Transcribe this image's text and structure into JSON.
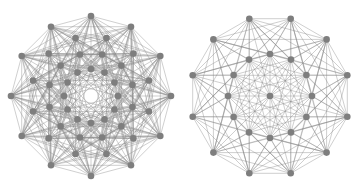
{
  "figure": {
    "width": 362,
    "height": 191,
    "colors": {
      "node": "#7e7e7e",
      "edge": "#8a8a8a",
      "background": "#ffffff"
    },
    "graphs": [
      {
        "name": "left-graph",
        "description": "dense circular graph with 4 concentric rings of 12 nodes, empty center",
        "center": [
          91,
          96
        ],
        "node_radius": 3.3,
        "rings": [
          {
            "count": 12,
            "radius": 80,
            "offset_deg": -90
          },
          {
            "count": 12,
            "radius": 60,
            "offset_deg": -75
          },
          {
            "count": 12,
            "radius": 43,
            "offset_deg": -75
          },
          {
            "count": 12,
            "radius": 27,
            "offset_deg": -90
          }
        ],
        "center_node": false,
        "edge_rule": "ring-skip"
      },
      {
        "name": "right-graph",
        "description": "circular graph with outer ring of 12, inner ring of 12, and one center node",
        "center": [
          270,
          96
        ],
        "node_radius": 3.3,
        "rings": [
          {
            "count": 12,
            "radius": 80,
            "offset_deg": -105
          },
          {
            "count": 12,
            "radius": 42,
            "offset_deg": -90
          }
        ],
        "center_node": true,
        "edge_rule": "ring-skip"
      }
    ]
  }
}
